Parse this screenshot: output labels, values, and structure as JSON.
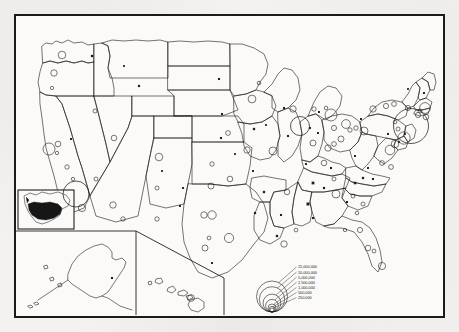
{
  "map": {
    "title": "United States population by metropolitan area",
    "type": "proportional-symbol-map",
    "projection_note": "conterminous United States with Alaska and Hawaii insets",
    "frame_color": "#1b1b1b",
    "land_fill": "#fbfaf8",
    "line_color": "#1f1f1f",
    "paper_color": "#f3f2f0"
  },
  "legend": {
    "name": "proportional-circle-legend",
    "symbol": "nested-circles",
    "entries": [
      {
        "label": "15,000,000",
        "value": 15000000
      },
      {
        "label": "10,000,000",
        "value": 10000000
      },
      {
        "label": "5,000,000",
        "value": 5000000
      },
      {
        "label": "2,500,000",
        "value": 2500000
      },
      {
        "label": "1,000,000",
        "value": 1000000
      },
      {
        "label": "500,000",
        "value": 500000
      },
      {
        "label": "250,000",
        "value": 250000
      }
    ]
  },
  "insets": [
    {
      "name": "locator-inset",
      "label": "North America locator",
      "highlight": "conterminous United States"
    },
    {
      "name": "alaska-inset",
      "label": "Alaska"
    },
    {
      "name": "hawaii-inset",
      "label": "Hawaii"
    }
  ],
  "chart_data": {
    "type": "scatter",
    "xlabel": "",
    "ylabel": "",
    "legend_position": "bottom-center",
    "symbol_encoding": "circle area proportional to population; small filled squares mark the smallest class",
    "legend_breaks": [
      250000,
      500000,
      1000000,
      2500000,
      5000000,
      10000000,
      15000000
    ],
    "points": [
      {
        "name": "New York",
        "x": 395,
        "y": 110,
        "r": 17.5,
        "filled": false
      },
      {
        "name": "Los Angeles",
        "x": 60,
        "y": 178,
        "r": 13.0,
        "filled": false
      },
      {
        "name": "Chicago",
        "x": 284,
        "y": 110,
        "r": 9.5,
        "filled": false
      },
      {
        "name": "Philadelphia",
        "x": 388,
        "y": 122,
        "r": 6.2,
        "filled": false
      },
      {
        "name": "Detroit",
        "x": 315,
        "y": 99,
        "r": 6.0,
        "filled": false
      },
      {
        "name": "San Francisco",
        "x": 33,
        "y": 133,
        "r": 6.0,
        "filled": false
      },
      {
        "name": "Boston",
        "x": 409,
        "y": 92,
        "r": 5.4,
        "filled": false
      },
      {
        "name": "Washington",
        "x": 374,
        "y": 134,
        "r": 4.8,
        "filled": false
      },
      {
        "name": "Cleveland",
        "x": 330,
        "y": 108,
        "r": 4.4,
        "filled": false
      },
      {
        "name": "Dallas",
        "x": 196,
        "y": 199,
        "r": 4.2,
        "filled": false
      },
      {
        "name": "Houston",
        "x": 213,
        "y": 222,
        "r": 4.6,
        "filled": false
      },
      {
        "name": "Pittsburgh",
        "x": 348,
        "y": 115,
        "r": 4.0,
        "filled": false
      },
      {
        "name": "St. Louis",
        "x": 257,
        "y": 135,
        "r": 4.0,
        "filled": false
      },
      {
        "name": "Baltimore",
        "x": 379,
        "y": 128,
        "r": 3.8,
        "filled": false
      },
      {
        "name": "Minneapolis",
        "x": 236,
        "y": 83,
        "r": 3.9,
        "filled": false
      },
      {
        "name": "Seattle",
        "x": 46,
        "y": 39,
        "r": 3.8,
        "filled": false
      },
      {
        "name": "Atlanta",
        "x": 320,
        "y": 178,
        "r": 4.0,
        "filled": false
      },
      {
        "name": "San Diego",
        "x": 66,
        "y": 192,
        "r": 3.6,
        "filled": false
      },
      {
        "name": "Miami",
        "x": 366,
        "y": 250,
        "r": 3.6,
        "filled": false
      },
      {
        "name": "Denver",
        "x": 143,
        "y": 141,
        "r": 3.8,
        "filled": false
      },
      {
        "name": "Cincinnati",
        "x": 312,
        "y": 132,
        "r": 3.2,
        "filled": false
      },
      {
        "name": "Milwaukee",
        "x": 277,
        "y": 93,
        "r": 3.2,
        "filled": false
      },
      {
        "name": "Kansas City",
        "x": 231,
        "y": 134,
        "r": 3.2,
        "filled": false
      },
      {
        "name": "Buffalo",
        "x": 357,
        "y": 93,
        "r": 3.2,
        "filled": false
      },
      {
        "name": "Portland",
        "x": 38,
        "y": 57,
        "r": 3.2,
        "filled": false
      },
      {
        "name": "New Orleans",
        "x": 268,
        "y": 228,
        "r": 3.2,
        "filled": false
      },
      {
        "name": "Phoenix",
        "x": 97,
        "y": 189,
        "r": 3.2,
        "filled": false
      },
      {
        "name": "Columbus",
        "x": 325,
        "y": 123,
        "r": 3.0,
        "filled": false
      },
      {
        "name": "Indianapolis",
        "x": 297,
        "y": 127,
        "r": 3.0,
        "filled": false
      },
      {
        "name": "San Antonio",
        "x": 189,
        "y": 232,
        "r": 3.0,
        "filled": false
      },
      {
        "name": "Fort Worth",
        "x": 188,
        "y": 199,
        "r": 3.2,
        "filled": false
      },
      {
        "name": "Memphis",
        "x": 271,
        "y": 176,
        "r": 2.8,
        "filled": false
      },
      {
        "name": "Sacramento",
        "x": 42,
        "y": 128,
        "r": 2.8,
        "filled": false
      },
      {
        "name": "Louisville",
        "x": 308,
        "y": 147,
        "r": 2.8,
        "filled": false
      },
      {
        "name": "Providence",
        "x": 410,
        "y": 101,
        "r": 2.8,
        "filled": false
      },
      {
        "name": "Oklahoma City",
        "x": 195,
        "y": 170,
        "r": 3.0,
        "filled": false
      },
      {
        "name": "Tulsa",
        "x": 214,
        "y": 163,
        "r": 2.8,
        "filled": false
      },
      {
        "name": "Salt Lake City",
        "x": 98,
        "y": 122,
        "r": 2.8,
        "filled": false
      },
      {
        "name": "Birmingham",
        "x": 292,
        "y": 188,
        "r": 2.6,
        "filled": true
      },
      {
        "name": "Albany",
        "x": 392,
        "y": 92,
        "r": 2.6,
        "filled": false
      },
      {
        "name": "Toledo",
        "x": 318,
        "y": 112,
        "r": 2.6,
        "filled": false
      },
      {
        "name": "Hartford",
        "x": 402,
        "y": 99,
        "r": 2.6,
        "filled": false
      },
      {
        "name": "Nashville",
        "x": 297,
        "y": 167,
        "r": 2.4,
        "filled": true
      },
      {
        "name": "Jacksonville",
        "x": 344,
        "y": 214,
        "r": 2.6,
        "filled": false
      },
      {
        "name": "Tampa",
        "x": 352,
        "y": 232,
        "r": 2.8,
        "filled": false
      },
      {
        "name": "Rochester",
        "x": 370,
        "y": 90,
        "r": 2.6,
        "filled": false
      },
      {
        "name": "Syracuse",
        "x": 378,
        "y": 88,
        "r": 2.4,
        "filled": false
      },
      {
        "name": "Dayton",
        "x": 318,
        "y": 128,
        "r": 2.4,
        "filled": false
      },
      {
        "name": "Richmond",
        "x": 366,
        "y": 147,
        "r": 2.4,
        "filled": false
      },
      {
        "name": "Norfolk",
        "x": 375,
        "y": 151,
        "r": 2.4,
        "filled": false
      },
      {
        "name": "Omaha",
        "x": 212,
        "y": 117,
        "r": 2.4,
        "filled": false
      },
      {
        "name": "Charlotte",
        "x": 339,
        "y": 167,
        "r": 2.2,
        "filled": true
      },
      {
        "name": "Grand Rapids",
        "x": 298,
        "y": 93,
        "r": 2.2,
        "filled": false
      },
      {
        "name": "Akron",
        "x": 334,
        "y": 114,
        "r": 2.2,
        "filled": false
      },
      {
        "name": "Youngstown",
        "x": 340,
        "y": 112,
        "r": 2.2,
        "filled": false
      },
      {
        "name": "Springfield MA",
        "x": 404,
        "y": 95,
        "r": 2.0,
        "filled": false
      },
      {
        "name": "Allentown",
        "x": 382,
        "y": 113,
        "r": 2.0,
        "filled": false
      },
      {
        "name": "Greensboro",
        "x": 347,
        "y": 162,
        "r": 2.0,
        "filled": true
      },
      {
        "name": "Wichita",
        "x": 196,
        "y": 148,
        "r": 2.2,
        "filled": false
      },
      {
        "name": "Knoxville",
        "x": 318,
        "y": 163,
        "r": 2.0,
        "filled": false
      },
      {
        "name": "Tucson",
        "x": 107,
        "y": 203,
        "r": 2.2,
        "filled": false
      },
      {
        "name": "El Paso",
        "x": 141,
        "y": 203,
        "r": 2.2,
        "filled": false
      },
      {
        "name": "Fresno",
        "x": 51,
        "y": 151,
        "r": 2.2,
        "filled": false
      },
      {
        "name": "Baton Rouge",
        "x": 261,
        "y": 220,
        "r": 2.0,
        "filled": true
      },
      {
        "name": "Columbia SC",
        "x": 337,
        "y": 180,
        "r": 2.0,
        "filled": false
      },
      {
        "name": "Charleston SC",
        "x": 347,
        "y": 188,
        "r": 2.0,
        "filled": false
      },
      {
        "name": "Little Rock",
        "x": 248,
        "y": 176,
        "r": 2.0,
        "filled": true
      },
      {
        "name": "Des Moines",
        "x": 238,
        "y": 113,
        "r": 2.0,
        "filled": true
      },
      {
        "name": "Spokane",
        "x": 76,
        "y": 40,
        "r": 2.0,
        "filled": true
      },
      {
        "name": "Boise",
        "x": 79,
        "y": 95,
        "r": 2.0,
        "filled": false
      },
      {
        "name": "Billings",
        "x": 123,
        "y": 70,
        "r": 1.9,
        "filled": true
      },
      {
        "name": "Albuquerque",
        "x": 141,
        "y": 172,
        "r": 2.0,
        "filled": false
      },
      {
        "name": "Las Vegas",
        "x": 80,
        "y": 163,
        "r": 2.0,
        "filled": false
      },
      {
        "name": "Shreveport",
        "x": 239,
        "y": 197,
        "r": 1.9,
        "filled": true
      },
      {
        "name": "Mobile",
        "x": 280,
        "y": 214,
        "r": 1.9,
        "filled": false
      },
      {
        "name": "Chattanooga",
        "x": 308,
        "y": 172,
        "r": 1.9,
        "filled": true
      },
      {
        "name": "Lexington",
        "x": 315,
        "y": 152,
        "r": 1.8,
        "filled": true
      },
      {
        "name": "Madison",
        "x": 268,
        "y": 92,
        "r": 1.8,
        "filled": true
      },
      {
        "name": "Peoria",
        "x": 272,
        "y": 120,
        "r": 1.8,
        "filled": true
      },
      {
        "name": "Lincoln",
        "x": 205,
        "y": 122,
        "r": 1.8,
        "filled": true
      },
      {
        "name": "Fargo",
        "x": 203,
        "y": 63,
        "r": 1.8,
        "filled": true
      },
      {
        "name": "Sioux Falls",
        "x": 206,
        "y": 98,
        "r": 1.8,
        "filled": true
      },
      {
        "name": "Duluth",
        "x": 243,
        "y": 67,
        "r": 1.8,
        "filled": false
      },
      {
        "name": "Jackson MS",
        "x": 265,
        "y": 199,
        "r": 1.8,
        "filled": true
      },
      {
        "name": "Montgomery",
        "x": 297,
        "y": 202,
        "r": 1.8,
        "filled": true
      },
      {
        "name": "Savannah",
        "x": 341,
        "y": 197,
        "r": 1.8,
        "filled": false
      },
      {
        "name": "Augusta",
        "x": 331,
        "y": 186,
        "r": 1.8,
        "filled": true
      },
      {
        "name": "Roanoke",
        "x": 352,
        "y": 152,
        "r": 1.7,
        "filled": true
      },
      {
        "name": "Charleston WV",
        "x": 339,
        "y": 140,
        "r": 1.7,
        "filled": true
      },
      {
        "name": "Harrisburg",
        "x": 372,
        "y": 118,
        "r": 1.7,
        "filled": true
      },
      {
        "name": "Scranton",
        "x": 379,
        "y": 106,
        "r": 1.8,
        "filled": false
      },
      {
        "name": "Erie",
        "x": 345,
        "y": 103,
        "r": 1.7,
        "filled": true
      },
      {
        "name": "Flint",
        "x": 310,
        "y": 92,
        "r": 1.8,
        "filled": false
      },
      {
        "name": "Lansing",
        "x": 303,
        "y": 96,
        "r": 1.7,
        "filled": true
      },
      {
        "name": "South Bend",
        "x": 294,
        "y": 112,
        "r": 1.7,
        "filled": true
      },
      {
        "name": "Fort Wayne",
        "x": 302,
        "y": 117,
        "r": 1.7,
        "filled": true
      },
      {
        "name": "Evansville",
        "x": 290,
        "y": 148,
        "r": 1.7,
        "filled": true
      },
      {
        "name": "Springfield MO",
        "x": 237,
        "y": 155,
        "r": 1.7,
        "filled": true
      },
      {
        "name": "Amarillo",
        "x": 167,
        "y": 172,
        "r": 1.7,
        "filled": true
      },
      {
        "name": "Lubbock",
        "x": 164,
        "y": 190,
        "r": 1.7,
        "filled": true
      },
      {
        "name": "Corpus Christi",
        "x": 196,
        "y": 247,
        "r": 1.7,
        "filled": true
      },
      {
        "name": "Austin",
        "x": 193,
        "y": 222,
        "r": 1.9,
        "filled": false
      },
      {
        "name": "Reno",
        "x": 55,
        "y": 123,
        "r": 1.7,
        "filled": true
      },
      {
        "name": "Bakersfield",
        "x": 57,
        "y": 163,
        "r": 1.7,
        "filled": false
      },
      {
        "name": "Stockton",
        "x": 41,
        "y": 137,
        "r": 1.7,
        "filled": false
      },
      {
        "name": "Eugene",
        "x": 36,
        "y": 72,
        "r": 1.7,
        "filled": false
      },
      {
        "name": "Portland ME",
        "x": 408,
        "y": 77,
        "r": 1.7,
        "filled": true
      },
      {
        "name": "Burlington",
        "x": 392,
        "y": 73,
        "r": 1.6,
        "filled": true
      },
      {
        "name": "Wilmington DE",
        "x": 383,
        "y": 126,
        "r": 1.6,
        "filled": true
      },
      {
        "name": "Trenton",
        "x": 389,
        "y": 118,
        "r": 1.6,
        "filled": true
      },
      {
        "name": "Raleigh",
        "x": 357,
        "y": 163,
        "r": 1.8,
        "filled": true
      },
      {
        "name": "Tallahassee",
        "x": 329,
        "y": 214,
        "r": 1.7,
        "filled": false
      },
      {
        "name": "Orlando",
        "x": 358,
        "y": 235,
        "r": 1.9,
        "filled": false
      },
      {
        "name": "Cedar Rapids",
        "x": 250,
        "y": 109,
        "r": 1.6,
        "filled": true
      },
      {
        "name": "Topeka",
        "x": 219,
        "y": 138,
        "r": 1.6,
        "filled": true
      },
      {
        "name": "Pueblo",
        "x": 146,
        "y": 155,
        "r": 1.6,
        "filled": true
      },
      {
        "name": "Great Falls",
        "x": 108,
        "y": 50,
        "r": 1.6,
        "filled": true
      },
      {
        "name": "Honolulu",
        "x": 175,
        "y": 282,
        "r": 3.4,
        "filled": false
      },
      {
        "name": "Anchorage",
        "x": 96,
        "y": 262,
        "r": 1.8,
        "filled": true
      }
    ]
  }
}
